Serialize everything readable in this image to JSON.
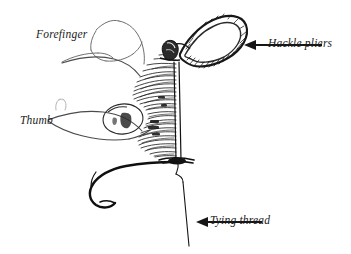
{
  "figure": {
    "background_color": "#ffffff",
    "ink_color": "#1a1a1a",
    "light_ink_color": "#8d8d8d",
    "mid_ink_color": "#4a4a4a"
  },
  "labels": [
    {
      "id": "forefinger",
      "text": "Forefinger",
      "has_arrow": false
    },
    {
      "id": "thumb",
      "text": "Thumb",
      "has_arrow": false
    },
    {
      "id": "hackle_pliers",
      "text": "Hackle pliers",
      "has_arrow": true,
      "arrow_direction": "left"
    },
    {
      "id": "tying_thread",
      "text": "Tying thread",
      "has_arrow": true,
      "arrow_direction": "left"
    }
  ],
  "parts": {
    "hand": "hand-outline",
    "forefinger": "forefinger-outline",
    "thumb": "thumb-outline",
    "thumbnail": "thumbnail-oval",
    "hackle_fibers": "hackle-fiber-hatching",
    "hackle_stem": "hackle-stem",
    "pliers_loop": "hackle-pliers-loop",
    "pliers_jaw": "hackle-pliers-jaw",
    "hook": "fish-hook",
    "thread": "tying-thread-line"
  },
  "arrows": {
    "hackle_pliers": {
      "tail_x": 322,
      "tail_y": 45,
      "head_x": 245,
      "head_y": 45
    },
    "tying_thread": {
      "tail_x": 262,
      "tail_y": 222,
      "head_x": 196,
      "head_y": 222
    }
  }
}
